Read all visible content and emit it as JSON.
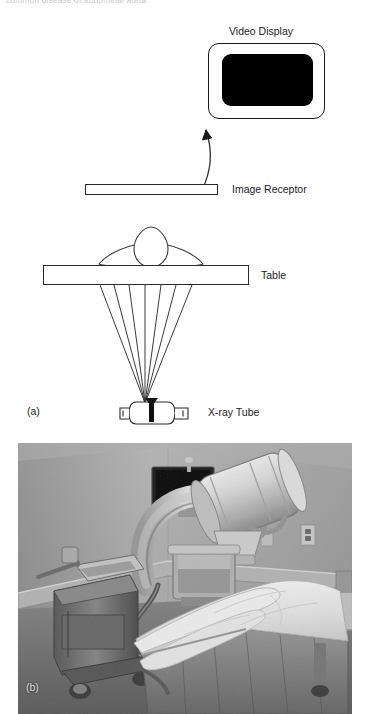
{
  "figure": {
    "top_caption": "common disease of abdominal aorta",
    "panel_a_label": "(a)",
    "panel_b_label": "(b)"
  },
  "diagram": {
    "components": [
      {
        "id": "video-display",
        "label": "Video Display",
        "shape": "rounded-rect-monitor",
        "screen_color": "#000000"
      },
      {
        "id": "image-receptor",
        "label": "Image Receptor",
        "shape": "thin-rect"
      },
      {
        "id": "table",
        "label": "Table",
        "shape": "rect"
      },
      {
        "id": "patient",
        "label": "",
        "shape": "body-cross-section"
      },
      {
        "id": "xray-tube",
        "label": "X-ray Tube",
        "shape": "tube-housing"
      }
    ],
    "labels": {
      "video_display": "Video Display",
      "image_receptor": "Image Receptor",
      "table": "Table",
      "xray_tube": "X-ray Tube"
    },
    "beam": {
      "ray_count": 7,
      "apex_x": 145,
      "apex_y": 400,
      "spread_description": "fan of x-rays diverging upward from tube focal spot to table"
    },
    "arrow": {
      "from": "image-receptor",
      "to": "video-display",
      "style": "curved-with-arrowhead"
    },
    "stroke_color": "#2a2a2a",
    "fill_color": "#ffffff"
  },
  "photograph": {
    "caption": "(b)",
    "description": "Mobile C-arm fluoroscopy unit positioned over a procedure table with white linens in a clinical room",
    "tone": "grayscale",
    "elements": [
      "c-arm gantry",
      "x-ray tube housing",
      "image intensifier",
      "video monitor on stand",
      "procedure table with pillows and sheets",
      "wall bumper rail",
      "wall outlet"
    ]
  }
}
